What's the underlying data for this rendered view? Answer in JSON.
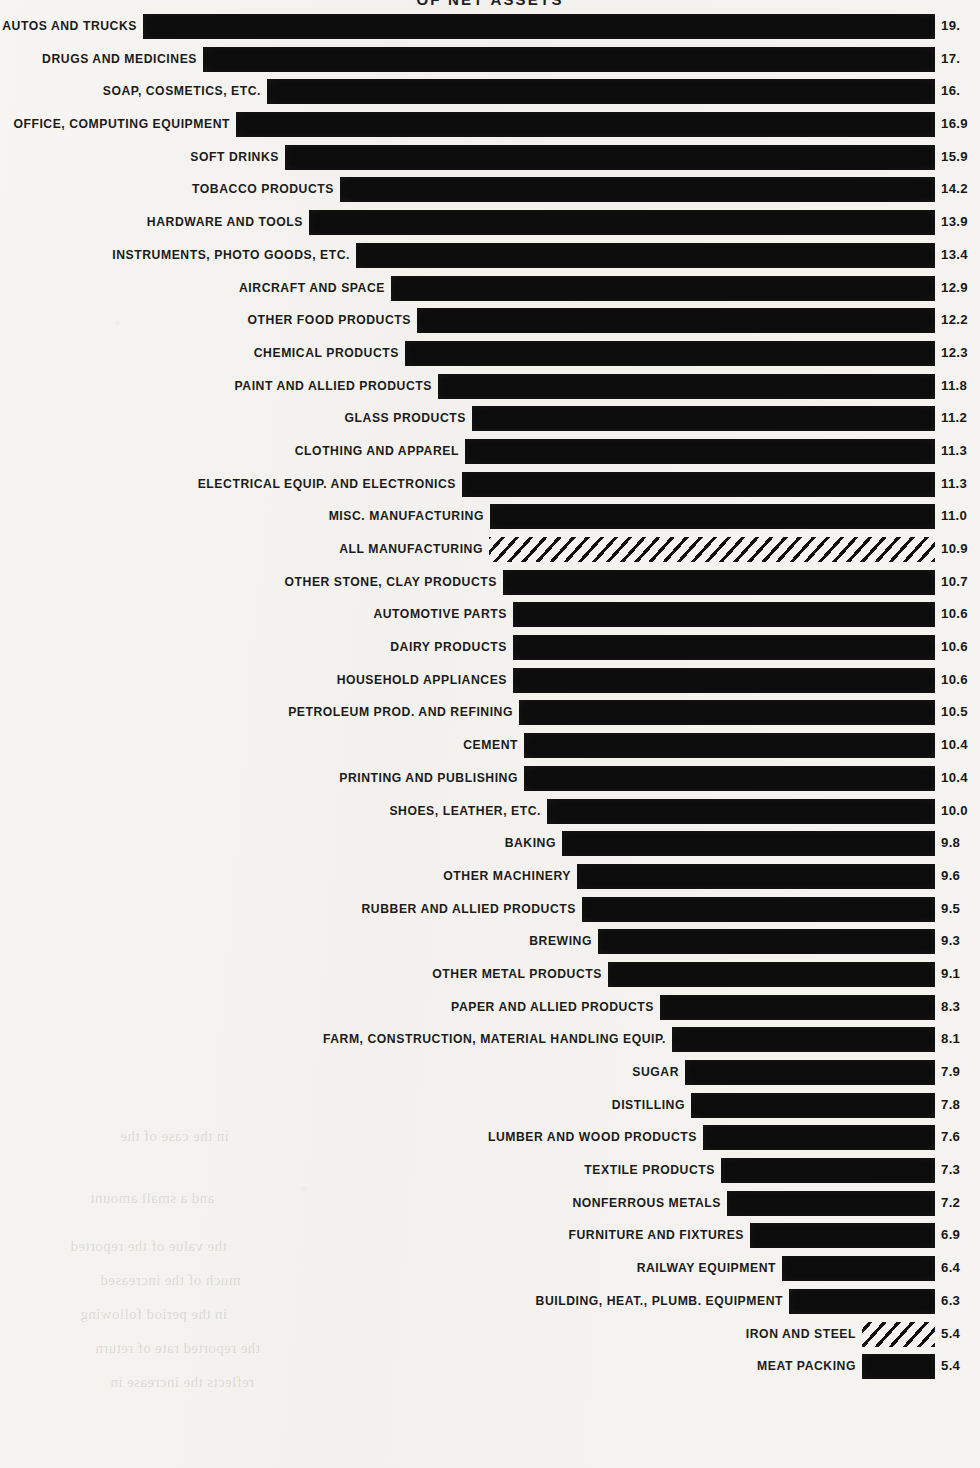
{
  "title": "OF NET ASSETS",
  "layout": {
    "bar_right_px": 935,
    "value_left_px": 941,
    "row_height_px": 32.7,
    "max_value": 19.8,
    "bar_scale_px_per_unit": 40.0
  },
  "colors": {
    "paper": "#f4f3f0",
    "ink": "#0c0c0c",
    "text": "#1b1b1a"
  },
  "ghost_text": [
    {
      "text": "in the case of the",
      "x": 120,
      "y": 1128
    },
    {
      "text": "and a small amount",
      "x": 90,
      "y": 1190
    },
    {
      "text": "the value of the reported",
      "x": 70,
      "y": 1238
    },
    {
      "text": "much of the increased",
      "x": 100,
      "y": 1272
    },
    {
      "text": "in the period following",
      "x": 80,
      "y": 1306
    },
    {
      "text": "the reported rate of return",
      "x": 95,
      "y": 1340
    },
    {
      "text": "reflects the increase in",
      "x": 110,
      "y": 1374
    }
  ],
  "chart_data": {
    "type": "bar",
    "orientation": "horizontal",
    "title": "OF NET ASSETS",
    "xlabel": "",
    "ylabel": "",
    "grid": false,
    "legend": [],
    "note": "Values are clipped at the right edge of the scan; trailing decimal digits are partly cut off.",
    "categories": [
      "AUTOS AND TRUCKS",
      "DRUGS AND MEDICINES",
      "SOAP, COSMETICS, ETC.",
      "OFFICE, COMPUTING EQUIPMENT",
      "SOFT DRINKS",
      "TOBACCO PRODUCTS",
      "HARDWARE AND TOOLS",
      "INSTRUMENTS, PHOTO GOODS, ETC.",
      "AIRCRAFT AND SPACE",
      "OTHER FOOD PRODUCTS",
      "CHEMICAL PRODUCTS",
      "PAINT AND ALLIED PRODUCTS",
      "GLASS PRODUCTS",
      "CLOTHING AND APPAREL",
      "ELECTRICAL EQUIP. AND ELECTRONICS",
      "MISC. MANUFACTURING",
      "ALL MANUFACTURING",
      "OTHER STONE, CLAY PRODUCTS",
      "AUTOMOTIVE PARTS",
      "DAIRY PRODUCTS",
      "HOUSEHOLD APPLIANCES",
      "PETROLEUM PROD. AND REFINING",
      "CEMENT",
      "PRINTING AND PUBLISHING",
      "SHOES, LEATHER, ETC.",
      "BAKING",
      "OTHER MACHINERY",
      "RUBBER AND ALLIED PRODUCTS",
      "BREWING",
      "OTHER METAL PRODUCTS",
      "PAPER AND ALLIED PRODUCTS",
      "FARM, CONSTRUCTION, MATERIAL HANDLING EQUIP.",
      "SUGAR",
      "DISTILLING",
      "LUMBER AND WOOD PRODUCTS",
      "TEXTILE PRODUCTS",
      "NONFERROUS METALS",
      "FURNITURE AND FIXTURES",
      "RAILWAY EQUIPMENT",
      "BUILDING, HEAT., PLUMB. EQUIPMENT",
      "IRON AND STEEL",
      "MEAT PACKING"
    ],
    "values": [
      19.8,
      17.8,
      16.8,
      16.9,
      15.9,
      14.2,
      13.9,
      13.4,
      12.9,
      12.2,
      12.3,
      11.8,
      11.2,
      11.3,
      11.3,
      11.0,
      10.9,
      10.7,
      10.6,
      10.6,
      10.6,
      10.5,
      10.4,
      10.4,
      10.0,
      9.8,
      9.6,
      9.5,
      9.3,
      9.1,
      8.3,
      8.1,
      7.9,
      7.8,
      7.6,
      7.3,
      7.2,
      6.9,
      6.4,
      6.3,
      5.4,
      5.4
    ],
    "value_labels": [
      "19.",
      "17.",
      "16.",
      "16.9",
      "15.9",
      "14.2",
      "13.9",
      "13.4",
      "12.9",
      "12.2",
      "12.3",
      "11.8",
      "11.2",
      "11.3",
      "11.3",
      "11.0",
      "10.9",
      "10.7",
      "10.6",
      "10.6",
      "10.6",
      "10.5",
      "10.4",
      "10.4",
      "10.0",
      "9.8",
      "9.6",
      "9.5",
      "9.3",
      "9.1",
      "8.3",
      "8.1",
      "7.9",
      "7.8",
      "7.6",
      "7.3",
      "7.2",
      "6.9",
      "6.4",
      "6.3",
      "5.4",
      "5.4"
    ],
    "bar_styles": [
      "solid",
      "solid",
      "solid",
      "solid",
      "solid",
      "solid",
      "solid",
      "solid",
      "solid",
      "solid",
      "solid",
      "solid",
      "solid",
      "solid",
      "solid",
      "solid",
      "hatched",
      "solid",
      "solid",
      "solid",
      "solid",
      "solid",
      "solid",
      "solid",
      "solid",
      "solid",
      "solid",
      "solid",
      "solid",
      "solid",
      "solid",
      "solid",
      "solid",
      "solid",
      "solid",
      "solid",
      "solid",
      "solid",
      "solid",
      "solid",
      "hatched",
      "solid"
    ],
    "bar_left_px": [
      143,
      203,
      267,
      236,
      285,
      340,
      309,
      356,
      391,
      417,
      405,
      438,
      472,
      465,
      462,
      490,
      489,
      503,
      513,
      513,
      513,
      519,
      524,
      524,
      547,
      562,
      577,
      582,
      598,
      608,
      660,
      672,
      685,
      691,
      703,
      721,
      727,
      750,
      782,
      789,
      862,
      862
    ]
  }
}
